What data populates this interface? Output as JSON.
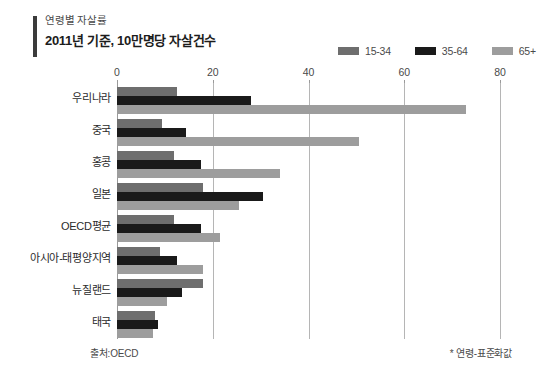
{
  "header": {
    "kicker": "연령별 자살률",
    "subtitle": "2011년 기준, 10만명당 자살건수"
  },
  "footer": {
    "source": "출처:OECD",
    "note": "* 연령-표준화값"
  },
  "legend": {
    "items": [
      {
        "label": "15-34",
        "color": "#6e6e6e"
      },
      {
        "label": "35-64",
        "color": "#1a1a1a"
      },
      {
        "label": "65+",
        "color": "#9d9d9d"
      }
    ]
  },
  "chart_data": {
    "type": "bar",
    "orientation": "horizontal",
    "title": "연령별 자살률",
    "subtitle": "2011년 기준, 10만명당 자살건수",
    "xlabel": "",
    "ylabel": "",
    "xlim": [
      0,
      80
    ],
    "xticks": [
      0,
      20,
      40,
      60,
      80
    ],
    "xtick_labels": [
      "0",
      "20",
      "40",
      "60",
      "80"
    ],
    "grid": true,
    "legend_position": "top-right",
    "categories": [
      "우리나라",
      "중국",
      "홍콩",
      "일본",
      "OECD평균",
      "아시아-태평양지역",
      "뉴질랜드",
      "태국"
    ],
    "series": [
      {
        "name": "15-34",
        "color": "#6e6e6e",
        "values": [
          12.5,
          9.5,
          12.0,
          18.0,
          12.0,
          9.0,
          18.0,
          8.0
        ]
      },
      {
        "name": "35-64",
        "color": "#1a1a1a",
        "values": [
          28.0,
          14.5,
          17.5,
          30.5,
          17.5,
          12.5,
          13.5,
          8.5
        ]
      },
      {
        "name": "65+",
        "color": "#9d9d9d",
        "values": [
          73.0,
          50.5,
          34.0,
          25.5,
          21.5,
          18.0,
          10.5,
          7.5
        ]
      }
    ]
  }
}
